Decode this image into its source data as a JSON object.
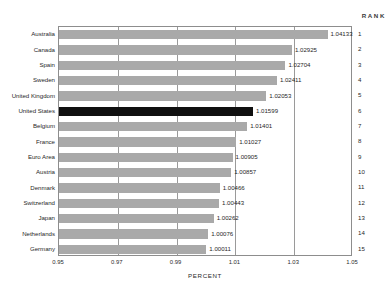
{
  "chart_data": {
    "type": "bar",
    "orientation": "horizontal",
    "title": "",
    "xlabel": "PERCENT",
    "ylabel": "",
    "xlim": [
      0.95,
      1.05
    ],
    "xticks": [
      "0.95",
      "0.97",
      "0.99",
      "1.01",
      "1.03",
      "1.05"
    ],
    "xtick_values": [
      0.95,
      0.97,
      0.99,
      1.01,
      1.03,
      1.05
    ],
    "grid": true,
    "legend": null,
    "categories": [
      "Australia",
      "Canada",
      "Spain",
      "Sweden",
      "United Kingdom",
      "United States",
      "Belgium",
      "France",
      "Euro Area",
      "Austria",
      "Denmark",
      "Switzerland",
      "Japan",
      "Netherlands",
      "Germany"
    ],
    "values": [
      1.04133,
      1.02925,
      1.02704,
      1.02411,
      1.02053,
      1.01599,
      1.01401,
      1.01027,
      1.00905,
      1.00857,
      1.00466,
      1.00443,
      1.00262,
      1.00076,
      1.00011
    ],
    "value_labels": [
      "1.04133",
      "1.02925",
      "1.02704",
      "1.02411",
      "1.02053",
      "1.01599",
      "1.01401",
      "1.01027",
      "1.00905",
      "1.00857",
      "1.00466",
      "1.00443",
      "1.00262",
      "1.00076",
      "1.00011"
    ],
    "ranks": [
      "1",
      "2",
      "3",
      "4",
      "5",
      "6",
      "7",
      "8",
      "9",
      "10",
      "11",
      "12",
      "13",
      "14",
      "15"
    ],
    "highlighted_category": "United States",
    "colors": {
      "bar": "#a9a9a9",
      "bar_highlight": "#101010",
      "grid": "#9a9a9a",
      "frame": "#8d8d8d",
      "text": "#1f1f1f"
    }
  },
  "rank_column": {
    "header": "RANK"
  }
}
